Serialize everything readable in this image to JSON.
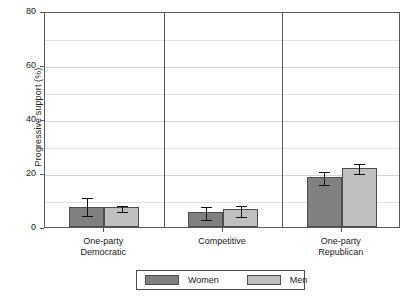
{
  "chart_data": {
    "type": "bar",
    "title": "",
    "subtitle": "",
    "xlabel": "",
    "ylabel": "Progressive support (%)",
    "ylim": [
      0,
      80
    ],
    "yticks": [
      0,
      20,
      40,
      60,
      80
    ],
    "ytick_labels": [
      "0",
      "20",
      "40",
      "60",
      "80"
    ],
    "minor_gridlines": [
      10,
      30,
      50,
      70
    ],
    "grid": "horizontal",
    "legend_position": "bottom",
    "faceted": true,
    "categories": [
      "One-party\nDemocratic",
      "Competitive",
      "One-party\nRepublican"
    ],
    "category_labels": [
      {
        "line1": "One-party",
        "line2": "Democratic"
      },
      {
        "line1": "Competitive",
        "line2": ""
      },
      {
        "line1": "One-party",
        "line2": "Republican"
      }
    ],
    "series": [
      {
        "name": "Women",
        "color": "#808080",
        "values": [
          7.5,
          5.5,
          18.5
        ],
        "err_low": [
          4.8,
          3.4,
          16.2
        ],
        "err_high": [
          11.4,
          8.2,
          21.2
        ]
      },
      {
        "name": "Men",
        "color": "#bfbfbf",
        "values": [
          7.5,
          6.5,
          22.0
        ],
        "err_low": [
          6.4,
          4.3,
          20.2
        ],
        "err_high": [
          8.6,
          8.5,
          23.9
        ]
      }
    ]
  },
  "legend": {
    "entries": [
      {
        "label": "Women",
        "color": "#808080"
      },
      {
        "label": "Men",
        "color": "#bfbfbf"
      }
    ]
  },
  "axis": {
    "y_title": "Progressive support (%)"
  },
  "colors": {
    "women": "#808080",
    "men": "#bfbfbf",
    "frame": "#5a5a5a",
    "grid_major": "#d2d2d2",
    "grid_minor": "#e2e2e2",
    "bar_outline": "#4d4d4d",
    "error_bar": "#111111",
    "background": "#ffffff"
  }
}
